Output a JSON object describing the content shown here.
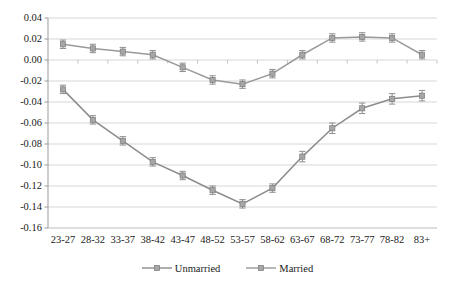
{
  "chart_data": {
    "type": "line",
    "title": "",
    "xlabel": "",
    "ylabel": "",
    "categories": [
      "23-27",
      "28-32",
      "33-37",
      "38-42",
      "43-47",
      "48-52",
      "53-57",
      "58-62",
      "63-67",
      "68-72",
      "73-77",
      "78-82",
      "83+"
    ],
    "ylim": [
      -0.16,
      0.04
    ],
    "ytick_labels": [
      "0.04",
      "0.02",
      "0.00",
      "-0.02",
      "-0.04",
      "-0.06",
      "-0.08",
      "-0.10",
      "-0.12",
      "-0.14",
      "-0.16"
    ],
    "ytick_values": [
      0.04,
      0.02,
      0.0,
      -0.02,
      -0.04,
      -0.06,
      -0.08,
      -0.1,
      -0.12,
      -0.14,
      -0.16
    ],
    "grid": true,
    "legend_position": "bottom",
    "series": [
      {
        "name": "Unmarried",
        "marker": "diamond",
        "color": "#8c8c8c",
        "values": [
          -0.028,
          -0.057,
          -0.077,
          -0.097,
          -0.11,
          -0.124,
          -0.137,
          -0.122,
          -0.092,
          -0.065,
          -0.046,
          -0.037,
          -0.034
        ],
        "errors": [
          0.004,
          0.004,
          0.004,
          0.004,
          0.004,
          0.004,
          0.004,
          0.004,
          0.005,
          0.005,
          0.005,
          0.005,
          0.005
        ]
      },
      {
        "name": "Married",
        "marker": "square",
        "color": "#9a9a9a",
        "values": [
          0.015,
          0.011,
          0.008,
          0.005,
          -0.007,
          -0.019,
          -0.023,
          -0.013,
          0.005,
          0.021,
          0.022,
          0.021,
          0.005
        ],
        "errors": [
          0.004,
          0.004,
          0.004,
          0.004,
          0.004,
          0.004,
          0.004,
          0.004,
          0.004,
          0.004,
          0.004,
          0.004,
          0.004
        ]
      }
    ]
  },
  "legend": {
    "entries": [
      {
        "label": "Unmarried"
      },
      {
        "label": "Married"
      }
    ]
  }
}
